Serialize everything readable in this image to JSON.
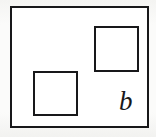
{
  "figure": {
    "kind": "line-diagram",
    "label": "b",
    "colors": {
      "stroke": "#18181a",
      "fill": "#ffffff",
      "page_background": "#f7f7f5"
    },
    "stroke_width_px": 2,
    "canvas": {
      "width": 156,
      "height": 137
    },
    "shapes": [
      {
        "name": "outer-rectangle",
        "type": "rectangle",
        "x": 10,
        "y": 6,
        "width": 139,
        "height": 122
      },
      {
        "name": "inner-square-top-right",
        "type": "square",
        "x": 92,
        "y": 24,
        "width": 45,
        "height": 46
      },
      {
        "name": "inner-square-bottom-left",
        "type": "square",
        "x": 31,
        "y": 69,
        "width": 45,
        "height": 45
      }
    ],
    "annotations": [
      {
        "name": "figure-label",
        "text": "b",
        "style": "italic-serif",
        "x": 119,
        "y": 88
      }
    ]
  }
}
